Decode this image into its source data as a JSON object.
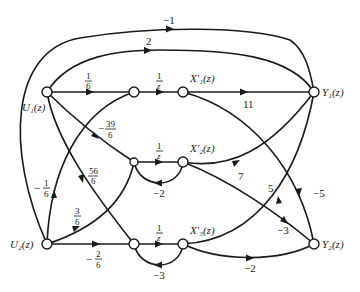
{
  "diagram": {
    "type": "signal-flow-graph",
    "nodes": {
      "u1": {
        "label": "U₁(z)"
      },
      "u2": {
        "label": "U₂(z)"
      },
      "n1": {
        "label": ""
      },
      "n2": {
        "label": ""
      },
      "n3": {
        "label": ""
      },
      "x1": {
        "label": "X′₁(z)"
      },
      "x2": {
        "label": "X′₂(z)"
      },
      "x3": {
        "label": "X′₃(z)"
      },
      "y1": {
        "label": "Y₁(z)"
      },
      "y2": {
        "label": "Y₂(z)"
      }
    },
    "edges": {
      "u2_y1": {
        "from": "U2",
        "to": "Y1",
        "gain": "−1"
      },
      "u1_y1": {
        "from": "U1",
        "to": "Y1",
        "gain": "2"
      },
      "u1_n1": {
        "from": "U1",
        "to": "n1",
        "num": "1",
        "den": "6"
      },
      "u1_n2": {
        "from": "U1",
        "to": "n2",
        "sign": "−",
        "num": "39",
        "den": "6"
      },
      "u1_n3": {
        "from": "U1",
        "to": "n3",
        "num": "56",
        "den": "6"
      },
      "u2_n1": {
        "from": "U2",
        "to": "n1",
        "sign": "−",
        "num": "1",
        "den": "6"
      },
      "u2_n2": {
        "from": "U2",
        "to": "n2",
        "num": "3",
        "den": "6"
      },
      "u2_n3": {
        "from": "U2",
        "to": "n3",
        "sign": "−",
        "num": "2",
        "den": "6"
      },
      "n1_x1": {
        "from": "n1",
        "to": "X1",
        "num": "1",
        "den": "z"
      },
      "n2_x2": {
        "from": "n2",
        "to": "X2",
        "num": "1",
        "den": "z"
      },
      "n3_x3": {
        "from": "n3",
        "to": "X3",
        "num": "1",
        "den": "z"
      },
      "x2_n2": {
        "from": "X2",
        "to": "n2",
        "gain": "−2"
      },
      "x3_n3": {
        "from": "X3",
        "to": "n3",
        "gain": "−3"
      },
      "x1_y1": {
        "from": "X1",
        "to": "Y1",
        "gain": "11"
      },
      "x1_y2": {
        "from": "X1",
        "to": "Y2",
        "gain": "−5"
      },
      "x2_y1": {
        "from": "X2",
        "to": "Y1",
        "gain": "7"
      },
      "x2_y2": {
        "from": "X2",
        "to": "Y2",
        "gain": "−3"
      },
      "x3_y1": {
        "from": "X3",
        "to": "Y1",
        "gain": "5"
      },
      "x3_y2": {
        "from": "X3",
        "to": "Y2",
        "gain": "−2"
      }
    }
  }
}
